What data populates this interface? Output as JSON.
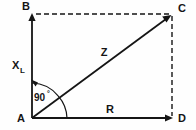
{
  "figure": {
    "type": "impedance-phasor-diagram",
    "background_color": "#fefefe",
    "stroke_color": "#151515"
  },
  "vertices": {
    "origin": {
      "label": "A",
      "x": 32,
      "y": 118
    },
    "top_left": {
      "label": "B",
      "x": 32,
      "y": 14
    },
    "top_right": {
      "label": "C",
      "x": 172,
      "y": 14
    },
    "bottom_right": {
      "label": "D",
      "x": 172,
      "y": 118
    }
  },
  "vectors": {
    "reactance": {
      "label": "X",
      "subscript": "L",
      "style": "solid-arrow"
    },
    "resistance": {
      "label": "R",
      "style": "solid-arrow"
    },
    "impedance": {
      "label": "Z",
      "style": "solid-arrow"
    }
  },
  "construction_lines": {
    "top": {
      "style": "dashed"
    },
    "right": {
      "style": "dashed"
    }
  },
  "angle": {
    "label": "90",
    "degree_symbol": "°",
    "style": "arc-with-arrow"
  }
}
